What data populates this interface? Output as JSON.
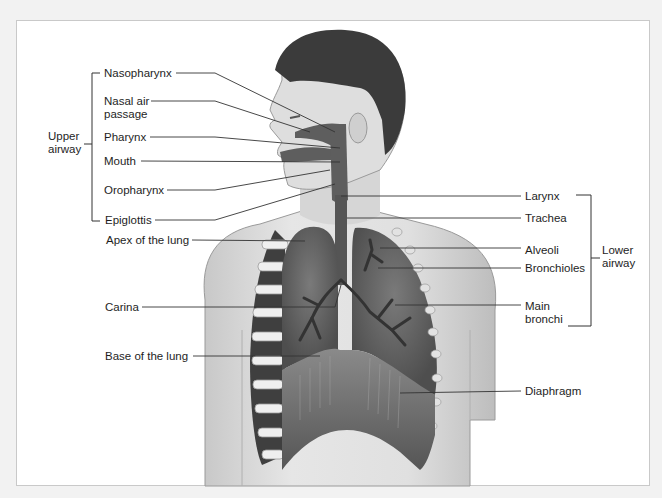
{
  "diagram": {
    "groups": {
      "upper": {
        "label_line1": "Upper",
        "label_line2": "airway"
      },
      "lower": {
        "label_line1": "Lower",
        "label_line2": "airway"
      }
    },
    "left_labels": {
      "nasopharynx": "Nasopharynx",
      "nasal_air_1": "Nasal air",
      "nasal_air_2": "passage",
      "pharynx": "Pharynx",
      "mouth": "Mouth",
      "oropharynx": "Oropharynx",
      "epiglottis": "Epiglottis",
      "apex": "Apex of the lung",
      "carina": "Carina",
      "base": "Base of the lung"
    },
    "right_labels": {
      "larynx": "Larynx",
      "trachea": "Trachea",
      "alveoli": "Alveoli",
      "bronchioles": "Bronchioles",
      "main_bronchi_1": "Main",
      "main_bronchi_2": "bronchi",
      "diaphragm": "Diaphragm"
    },
    "colors": {
      "skin": "#d9d9d9",
      "hair": "#3a3a3a",
      "airway": "#5a5a5a",
      "lung": "#6b6b6b",
      "line": "#333333"
    }
  }
}
